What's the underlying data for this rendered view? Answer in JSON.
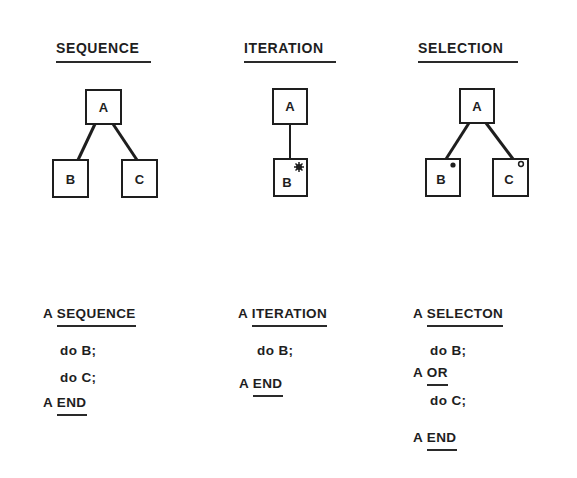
{
  "columns": [
    {
      "title": "SEQUENCE",
      "diagram": {
        "type": "sequence",
        "nodes": [
          {
            "id": "A",
            "label": "A",
            "marker": null
          },
          {
            "id": "B",
            "label": "B",
            "marker": null
          },
          {
            "id": "C",
            "label": "C",
            "marker": null
          }
        ],
        "edges": [
          [
            "A",
            "B"
          ],
          [
            "A",
            "C"
          ]
        ]
      },
      "code": {
        "open_prefix": "A",
        "open_keyword": "SEQUENCE",
        "lines": [
          "do B;",
          "do C;"
        ],
        "close_prefix": "A",
        "close_keyword": "END"
      }
    },
    {
      "title": "ITERATION",
      "diagram": {
        "type": "iteration",
        "nodes": [
          {
            "id": "A",
            "label": "A",
            "marker": null
          },
          {
            "id": "B",
            "label": "B",
            "marker": "asterisk"
          }
        ],
        "edges": [
          [
            "A",
            "B"
          ]
        ]
      },
      "code": {
        "open_prefix": "A",
        "open_keyword": "ITERATION",
        "lines": [
          "do B;"
        ],
        "close_prefix": "A",
        "close_keyword": "END"
      }
    },
    {
      "title": "SELECTION",
      "diagram": {
        "type": "selection",
        "nodes": [
          {
            "id": "A",
            "label": "A",
            "marker": null
          },
          {
            "id": "B",
            "label": "B",
            "marker": "circle"
          },
          {
            "id": "C",
            "label": "C",
            "marker": "circle"
          }
        ],
        "edges": [
          [
            "A",
            "B"
          ],
          [
            "A",
            "C"
          ]
        ]
      },
      "code": {
        "open_prefix": "A",
        "open_keyword": "SELECTON",
        "line_1": "do B;",
        "or_prefix": "A",
        "or_keyword": "OR",
        "line_2": "do C;",
        "close_prefix": "A",
        "close_keyword": "END"
      }
    }
  ],
  "colors": {
    "ink": "#1e1e1e",
    "background": "#ffffff"
  }
}
